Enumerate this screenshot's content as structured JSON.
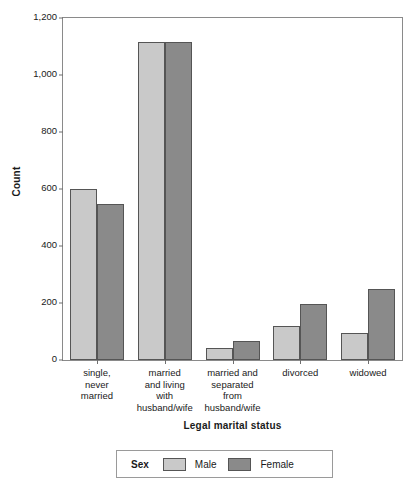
{
  "chart_data": {
    "type": "bar",
    "title": "",
    "xlabel": "Legal marital status",
    "ylabel": "Count",
    "grid": false,
    "legend_position": "bottom",
    "ylim": [
      0,
      1200
    ],
    "yticks": [
      0,
      200,
      400,
      600,
      800,
      1000,
      1200
    ],
    "ytick_labels": [
      "0",
      "200",
      "400",
      "600",
      "800",
      "1,000",
      "1,200"
    ],
    "categories": [
      "single, never married",
      "married and living with husband/wife",
      "married and separated from husband/wife",
      "divorced",
      "widowed"
    ],
    "category_label_lines": [
      [
        "single,",
        "never",
        "married"
      ],
      [
        "married",
        "and living",
        "with",
        "husband/wife"
      ],
      [
        "married and",
        "separated",
        "from",
        "husband/wife"
      ],
      [
        "divorced"
      ],
      [
        "widowed"
      ]
    ],
    "series": [
      {
        "name": "Male",
        "color": "#c9c9c9",
        "values": [
          600,
          1115,
          43,
          118,
          95
        ]
      },
      {
        "name": "Female",
        "color": "#8a8a8a",
        "values": [
          548,
          1115,
          65,
          196,
          250
        ]
      }
    ],
    "legend_title": "Sex"
  }
}
